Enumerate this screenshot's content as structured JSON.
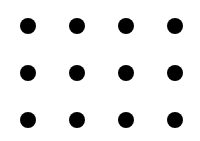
{
  "diagram": {
    "type": "dot-grid",
    "columns": 4,
    "rows": 3,
    "dot_color": "#000000",
    "background": "#ffffff",
    "dot_diameter": 16,
    "col_centers": [
      28,
      77,
      126,
      175
    ],
    "row_centers": [
      26,
      73,
      120
    ]
  }
}
